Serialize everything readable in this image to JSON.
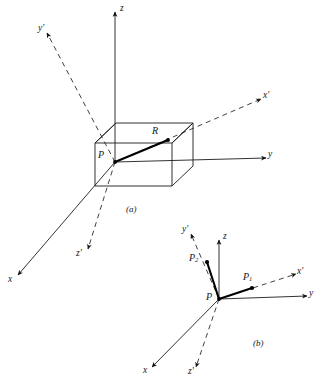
{
  "figure": {
    "caption_a": "(a)",
    "caption_b": "(b)",
    "ink_color": "#15181c",
    "background_color": "#ffffff"
  },
  "panel_a": {
    "name": "panel-a",
    "caption": "(a)",
    "axes": [
      {
        "key": "z",
        "label": "z",
        "style": "solid",
        "direction": "up"
      },
      {
        "key": "y",
        "label": "y",
        "style": "solid",
        "direction": "right"
      },
      {
        "key": "x",
        "label": "x",
        "style": "solid",
        "direction": "lower-left"
      },
      {
        "key": "zprime",
        "label": "z'",
        "style": "dashed",
        "direction": "down"
      },
      {
        "key": "yprime",
        "label": "y'",
        "style": "dashed",
        "direction": "upper-left"
      },
      {
        "key": "xprime",
        "label": "x'",
        "style": "dashed",
        "direction": "upper-right"
      }
    ],
    "points": [
      {
        "key": "P",
        "label": "P",
        "role": "origin"
      },
      {
        "key": "R",
        "label": "R",
        "role": "vector-tip"
      }
    ],
    "vectors": [
      {
        "key": "PR",
        "from": "P",
        "to": "R",
        "weight": "heavy"
      }
    ],
    "shape": {
      "name": "rectangular-box",
      "edges": 12,
      "style": "solid-outline"
    }
  },
  "panel_b": {
    "name": "panel-b",
    "caption": "(b)",
    "axes": [
      {
        "key": "z",
        "label": "z",
        "style": "solid",
        "direction": "up"
      },
      {
        "key": "y",
        "label": "y",
        "style": "solid",
        "direction": "right"
      },
      {
        "key": "x",
        "label": "x",
        "style": "solid",
        "direction": "lower-left"
      },
      {
        "key": "zprime",
        "label": "z'",
        "style": "dashed",
        "direction": "down"
      },
      {
        "key": "yprime",
        "label": "y'",
        "style": "dashed",
        "direction": "upper-left"
      },
      {
        "key": "xprime",
        "label": "x'",
        "style": "dashed",
        "direction": "upper-right"
      }
    ],
    "points": [
      {
        "key": "P",
        "label": "P",
        "role": "origin"
      },
      {
        "key": "P1",
        "label": "P",
        "sub": "1",
        "role": "vector-tip"
      },
      {
        "key": "P2",
        "label": "P",
        "sub": "2",
        "role": "vector-tip"
      }
    ],
    "vectors": [
      {
        "key": "PP1",
        "from": "P",
        "to": "P1",
        "weight": "heavy"
      },
      {
        "key": "PP2",
        "from": "P",
        "to": "P2",
        "weight": "heavy"
      }
    ]
  },
  "labels": {
    "a_z": "z",
    "a_y": "y",
    "a_x": "x",
    "a_zprime": "z'",
    "a_yprime": "y'",
    "a_xprime": "x'",
    "a_P": "P",
    "a_R": "R",
    "a_caption": "(a)",
    "b_z": "z",
    "b_y": "y",
    "b_x": "x",
    "b_zprime": "z'",
    "b_yprime": "y'",
    "b_xprime": "x'",
    "b_P": "P",
    "b_P1_base": "P",
    "b_P1_sub": "1",
    "b_P2_base": "P",
    "b_P2_sub": "2",
    "b_caption": "(b)"
  }
}
